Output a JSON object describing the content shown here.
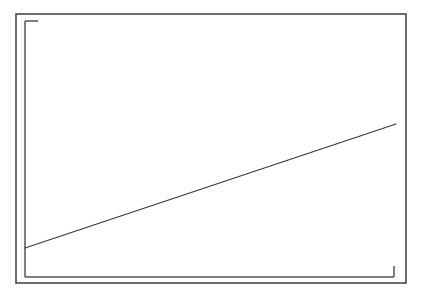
{
  "figure": {
    "kind": "scanned-line-chart",
    "canvas_width": 424,
    "canvas_height": 294,
    "background_color": "#ffffff",
    "title": "",
    "subtitle": "",
    "has_text_labels": false,
    "has_legend": false,
    "has_gridlines": false
  },
  "frame": {
    "name": "outer-border-rectangle",
    "x": 16,
    "y": 14,
    "width": 390,
    "height": 269,
    "stroke_color": "#4a4a4a",
    "stroke_width": 1.6
  },
  "axes": {
    "stroke_color": "#555555",
    "stroke_width": 1.5,
    "y_axis": {
      "name": "y-axis-line",
      "x": 25,
      "y_top": 21,
      "y_bottom": 277
    },
    "x_axis": {
      "name": "x-axis-line",
      "y": 277,
      "x_left": 25,
      "x_right": 394
    },
    "top_left_tick": {
      "name": "y-axis-top-tick",
      "y": 21,
      "x_start": 25,
      "x_end": 38
    },
    "bottom_right_tick": {
      "name": "x-axis-end-tick",
      "x": 394,
      "y_start": 266,
      "y_end": 277
    }
  },
  "chart_data": {
    "type": "line",
    "title": "",
    "subtitle": "",
    "xlabel": "",
    "ylabel": "",
    "xticklabels": [],
    "yticklabels": [],
    "legend": [],
    "legend_position": "none",
    "grid": false,
    "xlim": [
      0,
      100
    ],
    "ylim": [
      0,
      100
    ],
    "series": [
      {
        "name": "trend-line",
        "color": "#3a3a3a",
        "line_width": 1.3,
        "style": "solid",
        "markers": "none",
        "x": [
          0,
          100
        ],
        "y": [
          11.3,
          59.7
        ],
        "pixel_points": [
          {
            "x": 25,
            "y": 248
          },
          {
            "x": 396,
            "y": 124
          }
        ],
        "description": "single straight rising line from lower-left to upper-right"
      }
    ]
  }
}
